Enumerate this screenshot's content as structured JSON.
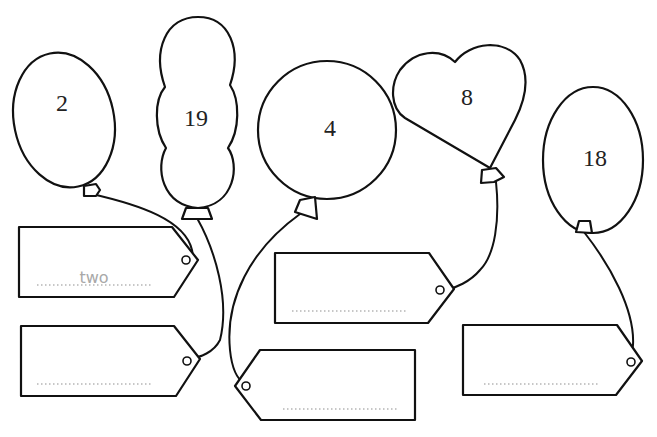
{
  "worksheet": {
    "balloons": [
      {
        "id": "balloon-1",
        "shape": "oval",
        "number": "2"
      },
      {
        "id": "balloon-2",
        "shape": "bubble-stack",
        "number": "19"
      },
      {
        "id": "balloon-3",
        "shape": "round",
        "number": "4"
      },
      {
        "id": "balloon-4",
        "shape": "heart",
        "number": "8"
      },
      {
        "id": "balloon-5",
        "shape": "oval",
        "number": "18"
      }
    ],
    "tags": [
      {
        "id": "tag-1",
        "answer": "two",
        "connected_to": "2"
      },
      {
        "id": "tag-2",
        "answer": "",
        "connected_to": "19"
      },
      {
        "id": "tag-3",
        "answer": "",
        "connected_to": "8"
      },
      {
        "id": "tag-4",
        "answer": "",
        "connected_to": "4"
      },
      {
        "id": "tag-5",
        "answer": "",
        "connected_to": "18"
      }
    ],
    "colors": {
      "ink": "#111111",
      "guide_dots": "#b5b5b5",
      "answer_text": "#a8a8a8"
    }
  }
}
